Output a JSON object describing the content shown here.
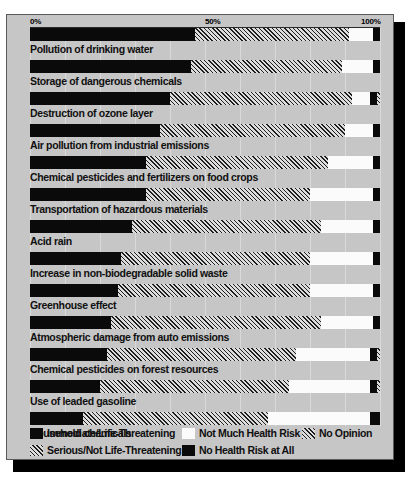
{
  "title_strip": "RISKS TO PUBLIC HEALTH AND THE ENVIRONMENT",
  "axis": {
    "ticks": [
      {
        "label": "0%",
        "pos": 0
      },
      {
        "label": "50%",
        "pos": 50
      },
      {
        "label": "100%",
        "pos": 100
      }
    ]
  },
  "legend": {
    "items": [
      {
        "key": "immediate",
        "label": "Immediate/Life-Threatening",
        "color": "#0a0a0a",
        "pattern": "solid"
      },
      {
        "key": "serious",
        "label": "Serious/Not Life-Threatening",
        "color": "#1f1f1f",
        "pattern": "diagonal-hatch"
      },
      {
        "key": "notmuch",
        "label": "Not Much Health Risk",
        "color": "#fbfbfb",
        "pattern": "solid"
      },
      {
        "key": "norisk",
        "label": "No Health Risk at All",
        "color": "#0a0a0a",
        "pattern": "solid"
      },
      {
        "key": "noopinion",
        "label": "No Opinion",
        "color": "#1f1f1f",
        "pattern": "diagonal-hatch"
      }
    ]
  },
  "chart_data": {
    "type": "bar",
    "orientation": "horizontal",
    "stacked": true,
    "title": "RISKS TO PUBLIC HEALTH AND THE ENVIRONMENT",
    "xlabel": "",
    "ylabel": "",
    "xlim": [
      0,
      100
    ],
    "xticks": [
      0,
      50,
      100
    ],
    "xticklabels": [
      "0%",
      "50%",
      "100%"
    ],
    "grid": true,
    "legend_position": "bottom",
    "categories": [
      "Pollution of drinking water",
      "Storage of dangerous chemicals",
      "Destruction of ozone layer",
      "Air pollution from industrial emissions",
      "Chemical pesticides and fertilizers on food crops",
      "Transportation of hazardous materials",
      "Acid rain",
      "Increase in non-biodegradable solid waste",
      "Greenhouse effect",
      "Atmospheric damage from auto emissions",
      "Chemical pesticides on forest resources",
      "Use of leaded gasoline",
      "Household chemicals"
    ],
    "series": [
      {
        "name": "Immediate/Life-Threatening",
        "key": "immediate",
        "values": [
          47,
          46,
          40,
          37,
          33,
          33,
          29,
          26,
          25,
          23,
          22,
          20,
          15
        ]
      },
      {
        "name": "Serious/Not Life-Threatening",
        "key": "serious",
        "values": [
          44,
          43,
          52,
          53,
          52,
          47,
          54,
          54,
          55,
          60,
          54,
          54,
          53
        ]
      },
      {
        "name": "Not Much Health Risk",
        "key": "notmuch",
        "values": [
          7,
          9,
          5,
          8,
          13,
          18,
          15,
          18,
          18,
          15,
          21,
          23,
          29
        ]
      },
      {
        "name": "No Health Risk at All",
        "key": "norisk",
        "values": [
          2,
          2,
          2,
          2,
          2,
          2,
          2,
          2,
          2,
          2,
          2,
          2,
          3
        ]
      },
      {
        "name": "No Opinion",
        "key": "noopinion",
        "values": [
          0,
          0,
          1,
          0,
          0,
          0,
          0,
          0,
          0,
          0,
          1,
          1,
          0
        ]
      }
    ]
  }
}
